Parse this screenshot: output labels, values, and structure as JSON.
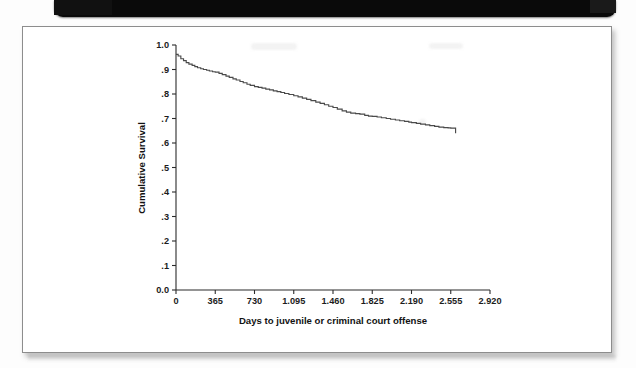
{
  "document": {
    "type": "scanned-figure-page",
    "card_background": "#ffffff",
    "card_border_color": "#8d8d8d",
    "scan_edge_color": "#0a0a0a"
  },
  "chart_data": {
    "type": "line",
    "title": "",
    "subtitle": "",
    "xlabel": "Days to juvenile or criminal court offense",
    "ylabel": "Cumulative Survival",
    "xlim": [
      0,
      2920
    ],
    "ylim": [
      0.0,
      1.0
    ],
    "grid": false,
    "legend": null,
    "xticks": [
      0,
      365,
      730,
      1095,
      1460,
      1825,
      2190,
      2555,
      2920
    ],
    "xtick_labels": [
      "0",
      "365",
      "730",
      "1.095",
      "1.460",
      "1.825",
      "2.190",
      "2.555",
      "2.920"
    ],
    "yticks": [
      0.0,
      0.1,
      0.2,
      0.3,
      0.4,
      0.5,
      0.6,
      0.7,
      0.8,
      0.9,
      1.0
    ],
    "ytick_labels": [
      "0.0",
      ".1",
      ".2",
      ".3",
      ".4",
      ".5",
      ".6",
      ".7",
      ".8",
      ".9",
      "1.0"
    ],
    "line_color": "#4a4a4a",
    "series": [
      {
        "name": "Cumulative survival",
        "step": true,
        "x": [
          0,
          20,
          45,
          70,
          95,
          120,
          150,
          175,
          200,
          230,
          255,
          285,
          310,
          340,
          365,
          400,
          430,
          465,
          495,
          530,
          560,
          595,
          625,
          660,
          690,
          730,
          765,
          800,
          835,
          870,
          905,
          940,
          975,
          1010,
          1050,
          1095,
          1135,
          1175,
          1215,
          1255,
          1300,
          1340,
          1380,
          1420,
          1460,
          1500,
          1545,
          1585,
          1625,
          1670,
          1710,
          1755,
          1790,
          1825,
          1870,
          1910,
          1955,
          1995,
          2040,
          2080,
          2125,
          2165,
          2190,
          2235,
          2275,
          2320,
          2360,
          2405,
          2445,
          2490,
          2530,
          2555,
          2590,
          2600
        ],
        "y": [
          0.962,
          0.955,
          0.944,
          0.936,
          0.928,
          0.922,
          0.917,
          0.912,
          0.907,
          0.903,
          0.9,
          0.897,
          0.894,
          0.891,
          0.889,
          0.884,
          0.879,
          0.873,
          0.868,
          0.862,
          0.857,
          0.851,
          0.846,
          0.84,
          0.835,
          0.83,
          0.827,
          0.824,
          0.82,
          0.817,
          0.813,
          0.81,
          0.806,
          0.802,
          0.798,
          0.793,
          0.788,
          0.783,
          0.778,
          0.773,
          0.767,
          0.762,
          0.756,
          0.75,
          0.745,
          0.738,
          0.731,
          0.726,
          0.722,
          0.72,
          0.718,
          0.713,
          0.71,
          0.709,
          0.706,
          0.703,
          0.7,
          0.697,
          0.694,
          0.691,
          0.688,
          0.685,
          0.683,
          0.68,
          0.677,
          0.674,
          0.671,
          0.668,
          0.665,
          0.663,
          0.662,
          0.661,
          0.661,
          0.64
        ]
      }
    ]
  }
}
